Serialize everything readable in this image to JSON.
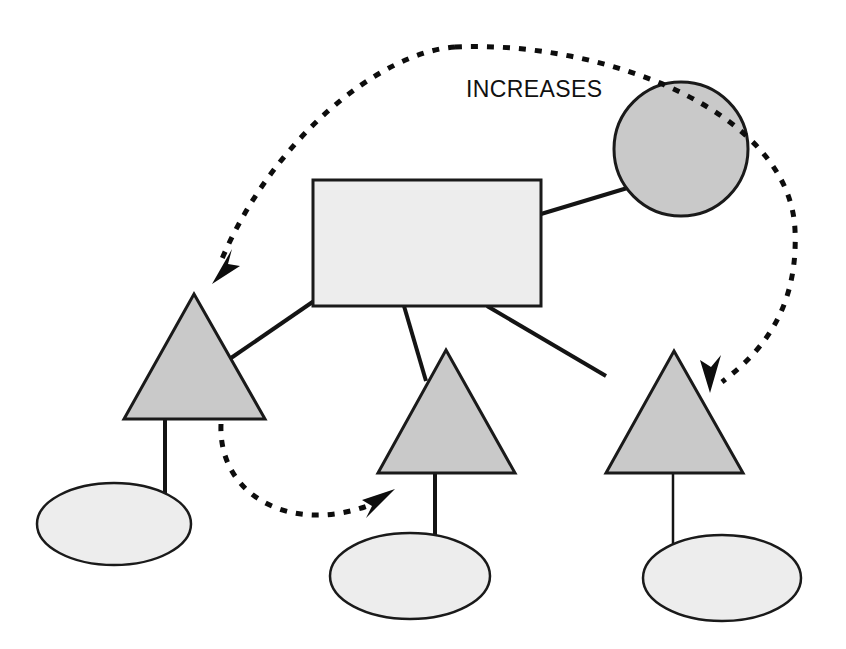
{
  "diagram": {
    "title": "",
    "background_color": "#FFFFFF",
    "labels": [
      {
        "id": "increases-label",
        "text": "INCREASES",
        "x": 466,
        "y": 97,
        "font_size": 23,
        "color": "#111111"
      }
    ],
    "colors": {
      "rectangle_fill": "#EDEDED",
      "circle_fill": "#C9C9C9",
      "triangle_fill": "#C9C9C9",
      "ellipse_fill": "#EDEDED",
      "stroke": "#1A1A1A",
      "connector": "#141414",
      "dashed_arrow": "#0D0D0D"
    },
    "nodes": [
      {
        "id": "rectangle-node",
        "name": "rectangle-node",
        "shape": "rectangle",
        "x": 313,
        "y": 180,
        "width": 228,
        "height": 126,
        "fill": "#EDEDED",
        "stroke_width": 3,
        "label": ""
      },
      {
        "id": "circle-node",
        "name": "circle-node",
        "shape": "circle",
        "cx": 681,
        "cy": 149,
        "r": 67,
        "fill": "#C9C9C9",
        "stroke_width": 3,
        "label": ""
      },
      {
        "id": "triangle-left",
        "name": "triangle-left",
        "shape": "triangle",
        "apex_x": 194,
        "apex_y": 294,
        "base_left_x": 124,
        "base_right_x": 265,
        "base_y": 419,
        "fill": "#C9C9C9",
        "stroke_width": 3,
        "label": ""
      },
      {
        "id": "triangle-middle",
        "name": "triangle-middle",
        "shape": "triangle",
        "apex_x": 446,
        "apex_y": 350,
        "base_left_x": 378,
        "base_right_x": 515,
        "base_y": 473,
        "fill": "#C9C9C9",
        "stroke_width": 3,
        "label": ""
      },
      {
        "id": "triangle-right",
        "name": "triangle-right",
        "shape": "triangle",
        "apex_x": 674,
        "apex_y": 351,
        "base_left_x": 606,
        "base_right_x": 743,
        "base_y": 473,
        "fill": "#C9C9C9",
        "stroke_width": 3,
        "label": ""
      },
      {
        "id": "ellipse-left",
        "name": "ellipse-left",
        "shape": "ellipse",
        "cx": 114,
        "cy": 524,
        "rx": 77,
        "ry": 41,
        "fill": "#EDEDED",
        "stroke_width": 2.5,
        "label": ""
      },
      {
        "id": "ellipse-middle",
        "name": "ellipse-middle",
        "shape": "ellipse",
        "cx": 410,
        "cy": 576,
        "rx": 80,
        "ry": 43,
        "fill": "#EDEDED",
        "stroke_width": 2.5,
        "label": ""
      },
      {
        "id": "ellipse-right",
        "name": "ellipse-right",
        "shape": "ellipse",
        "cx": 722,
        "cy": 578,
        "rx": 79,
        "ry": 43,
        "fill": "#EDEDED",
        "stroke_width": 2.5,
        "label": ""
      }
    ],
    "connectors": [
      {
        "id": "connector-rect-to-circle",
        "name": "connector-rect-to-circle",
        "from": "rectangle-node",
        "to": "circle-node",
        "x1": 541,
        "y1": 214,
        "x2": 634,
        "y2": 186,
        "stroke_width": 4
      },
      {
        "id": "connector-rect-to-triangle-left",
        "name": "connector-rect-to-triangle-left",
        "from": "rectangle-node",
        "to": "triangle-left",
        "x1": 314,
        "y1": 301,
        "x2": 231,
        "y2": 358,
        "stroke_width": 4
      },
      {
        "id": "connector-rect-to-triangle-middle",
        "name": "connector-rect-to-triangle-middle",
        "from": "rectangle-node",
        "to": "triangle-middle",
        "x1": 404,
        "y1": 306,
        "x2": 426,
        "y2": 381,
        "stroke_width": 4
      },
      {
        "id": "connector-rect-to-triangle-right",
        "name": "connector-rect-to-triangle-right",
        "from": "rectangle-node",
        "to": "triangle-right",
        "x1": 487,
        "y1": 306,
        "x2": 606,
        "y2": 376,
        "stroke_width": 4
      },
      {
        "id": "stem-triangle-left-to-ellipse-left",
        "name": "stem-triangle-left-to-ellipse-left",
        "from": "triangle-left",
        "to": "ellipse-left",
        "x1": 165,
        "y1": 419,
        "x2": 165,
        "y2": 500,
        "stroke_width": 4
      },
      {
        "id": "stem-triangle-middle-to-ellipse-middle",
        "name": "stem-triangle-middle-to-ellipse-middle",
        "from": "triangle-middle",
        "to": "ellipse-middle",
        "x1": 435,
        "y1": 473,
        "x2": 435,
        "y2": 548,
        "stroke_width": 4
      },
      {
        "id": "stem-triangle-right-to-ellipse-right",
        "name": "stem-triangle-right-to-ellipse-right",
        "from": "triangle-right",
        "to": "ellipse-right",
        "x1": 673,
        "y1": 473,
        "x2": 673,
        "y2": 551,
        "stroke_width": 2.5
      }
    ],
    "dashed_arrows": [
      {
        "id": "dashed-arrow-to-triangle-left",
        "name": "dashed-arrow-to-triangle-left",
        "relation": "INCREASES",
        "path": "M 455 47 C 380 52 270 140 219 266",
        "arrow_tip_x": 214,
        "arrow_tip_y": 281,
        "arrow_angle": 250,
        "dash": "7 9",
        "stroke_width": 5
      },
      {
        "id": "dashed-arrow-to-triangle-right",
        "name": "dashed-arrow-to-triangle-right",
        "relation": "INCREASES",
        "path": "M 455 47 C 600 40 790 110 795 230 C 799 320 750 360 722 382",
        "arrow_tip_x": 712,
        "arrow_tip_y": 391,
        "arrow_angle": 133,
        "dash": "7 9",
        "stroke_width": 5
      },
      {
        "id": "dashed-arrow-to-triangle-middle",
        "name": "dashed-arrow-to-triangle-middle",
        "relation": "INCREASES",
        "path": "M 221 424 C 218 495 290 535 370 505",
        "arrow_tip_x": 393,
        "arrow_tip_y": 492,
        "arrow_angle": 335,
        "dash": "7 9",
        "stroke_width": 5
      }
    ]
  }
}
